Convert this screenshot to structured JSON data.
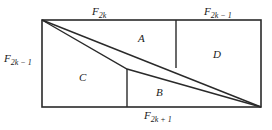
{
  "diagram": {
    "type": "fibonacci-rectangle-dissection",
    "colors": {
      "stroke": "#2a2a2a",
      "text": "#1a1a1a",
      "background": "#ffffff"
    },
    "edge_labels": {
      "top_left": {
        "base": "F",
        "sub": "2k"
      },
      "top_right": {
        "base": "F",
        "sub": "2k − 1"
      },
      "left": {
        "base": "F",
        "sub": "2k − 1"
      },
      "bottom": {
        "base": "F",
        "sub": "2k + 1"
      }
    },
    "regions": {
      "A": "A",
      "B": "B",
      "C": "C",
      "D": "D"
    }
  }
}
